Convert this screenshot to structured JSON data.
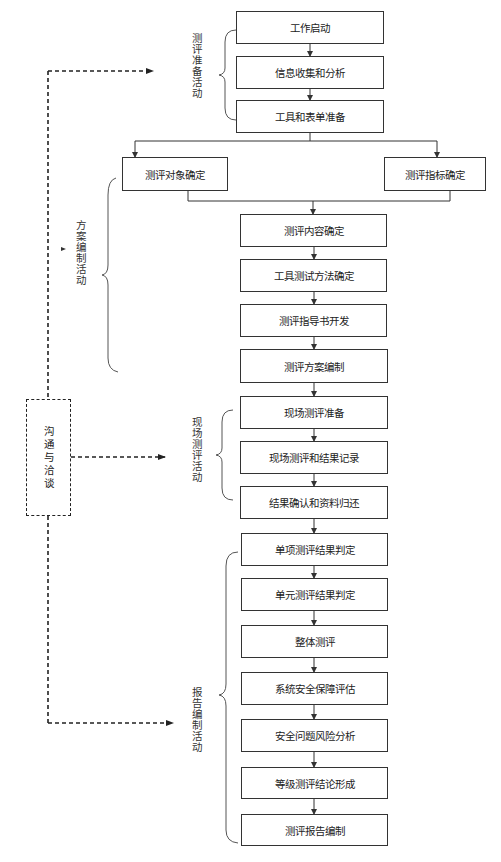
{
  "diagram": {
    "type": "flowchart",
    "colors": {
      "line": "#333333",
      "dashed": "#222222",
      "background": "#ffffff"
    },
    "phases": [
      {
        "id": "prep",
        "label": "测评准备活动"
      },
      {
        "id": "plan",
        "label": "方案编制活动"
      },
      {
        "id": "field",
        "label": "现场测评活动"
      },
      {
        "id": "report",
        "label": "报告编制活动"
      }
    ],
    "communication": {
      "label": "沟通与洽谈"
    },
    "steps": {
      "s1": "工作启动",
      "s2": "信息收集和分析",
      "s3": "工具和表单准备",
      "s3a": "测评对象确定",
      "s3b": "测评指标确定",
      "s4": "测评内容确定",
      "s5": "工具测试方法确定",
      "s6": "测评指导书开发",
      "s7": "测评方案编制",
      "s8": "现场测评准备",
      "s9": "现场测评和结果记录",
      "s10": "结果确认和资料归还",
      "s11": "单项测评结果判定",
      "s12": "单元测评结果判定",
      "s13": "整体测评",
      "s14": "系统安全保障评估",
      "s15": "安全问题风险分析",
      "s16": "等级测评结论形成",
      "s17": "测评报告编制"
    }
  }
}
